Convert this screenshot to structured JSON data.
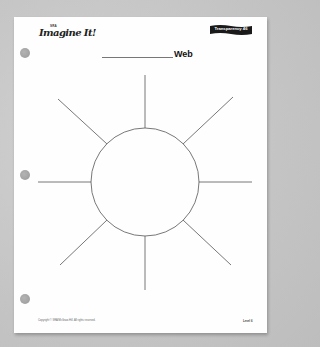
{
  "header": {
    "logo_top": "SRA",
    "logo_main": "Imagine It!",
    "transparency_label": "Transparency 46"
  },
  "title": {
    "blank": "",
    "label": "Web"
  },
  "diagram": {
    "type": "web",
    "center_shape": "circle",
    "spokes": 8,
    "colors": {
      "line": "#555555",
      "page": "#fefefe"
    }
  },
  "footer": {
    "copyright": "Copyright © SRA/McGraw-Hill. All rights reserved.",
    "level": "Level 6"
  }
}
